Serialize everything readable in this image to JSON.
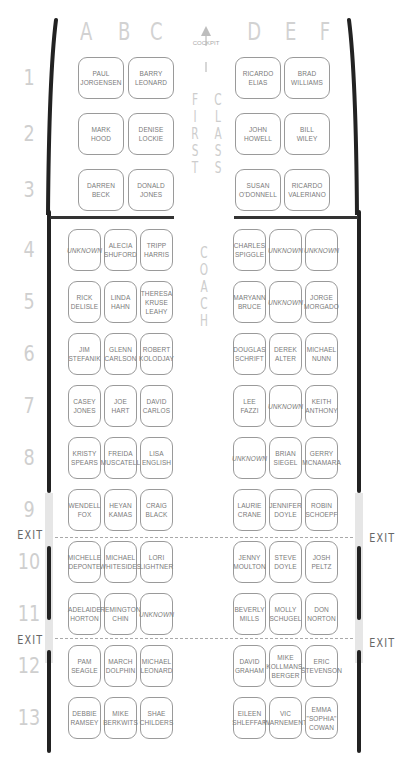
{
  "columns_left": [
    "A",
    "B",
    "C"
  ],
  "columns_right": [
    "D",
    "E",
    "F"
  ],
  "cockpit_label": "COCKPIT",
  "first_class_label": [
    "F",
    "I",
    "R",
    "S",
    "T"
  ],
  "class_label": [
    "C",
    "L",
    "A",
    "S",
    "S"
  ],
  "coach_label": [
    "C",
    "O",
    "A",
    "C",
    "H"
  ],
  "exit_label": "EXIT",
  "rows": [
    {
      "num": "1",
      "left": [
        "",
        "PAUL\nJORGENSEN",
        "BARRY\nLEONARD"
      ],
      "right": [
        "RICARDO\nELIAS",
        "BRAD\nWILLIAMS",
        ""
      ]
    },
    {
      "num": "2",
      "left": [
        "",
        "MARK\nHOOD",
        "DENISE\nLOCKIE"
      ],
      "right": [
        "JOHN\nHOWELL",
        "BILL\nWILEY",
        ""
      ]
    },
    {
      "num": "3",
      "left": [
        "",
        "DARREN\nBECK",
        "DONALD\nJONES"
      ],
      "right": [
        "SUSAN\nO'DONNELL",
        "RICARDO\nVALERIANO",
        ""
      ]
    },
    {
      "num": "4",
      "left": [
        "UNKNOWN",
        "ALECIA\nSHUFORD",
        "TRIPP\nHARRIS"
      ],
      "right": [
        "CHARLES\nSPIGGLE",
        "UNKNOWN",
        "UNKNOWN"
      ]
    },
    {
      "num": "5",
      "left": [
        "RICK\nDELISLE",
        "LINDA\nHAHN",
        "THERESA\nKRUSE\nLEAHY"
      ],
      "right": [
        "MARYANN\nBRUCE",
        "UNKNOWN",
        "JORGE\nMORGADO"
      ]
    },
    {
      "num": "6",
      "left": [
        "JIM\nSTEFANIK",
        "GLENN\nCARLSON",
        "ROBERT\nKOLODJAY"
      ],
      "right": [
        "DOUGLAS\nSCHRIFT",
        "DEREK\nALTER",
        "MICHAEL\nNUNN"
      ]
    },
    {
      "num": "7",
      "left": [
        "CASEY\nJONES",
        "JOE\nHART",
        "DAVID\nCARLOS"
      ],
      "right": [
        "LEE\nFAZZI",
        "UNKNOWN",
        "KEITH\nANTHONY"
      ]
    },
    {
      "num": "8",
      "left": [
        "KRISTY\nSPEARS",
        "FREIDA\nMUSCATELL",
        "LISA\nENGLISH"
      ],
      "right": [
        "UNKNOWN",
        "BRIAN\nSIEGEL",
        "GERRY\nMCNAMARA"
      ]
    },
    {
      "num": "9",
      "left": [
        "WENDELL\nFOX",
        "HEYAN\nKAMAS",
        "CRAIG\nBLACK"
      ],
      "right": [
        "LAURIE\nCRANE",
        "JENNIFER\nDOYLE",
        "ROBIN\nSCHOEPF"
      ]
    },
    {
      "num": "10",
      "left": [
        "MICHELLE\nDEPONTE",
        "MICHAEL\nWHITESIDES",
        "LORI\nLIGHTNER"
      ],
      "right": [
        "JENNY\nMOULTON",
        "STEVE\nDOYLE",
        "JOSH\nPELTZ"
      ]
    },
    {
      "num": "11",
      "left": [
        "ADELAIDE\nHORTON",
        "REMINGTON\nCHIN",
        "UNKNOWN"
      ],
      "right": [
        "BEVERLY\nMILLS",
        "MOLLY\nSCHUGEL",
        "DON\nNORTON"
      ]
    },
    {
      "num": "12",
      "left": [
        "PAM\nSEAGLE",
        "MARCH\nDOLPHIN",
        "MICHAEL\nLEONARD"
      ],
      "right": [
        "DAVID\nGRAHAM",
        "MIKE\nKOLLMANS-\nBERGER",
        "ERIC\nSTEVENSON"
      ]
    },
    {
      "num": "13",
      "left": [
        "DEBBIE\nRAMSEY",
        "MIKE\nBERKWITS",
        "SHAE\nCHILDERS"
      ],
      "right": [
        "EILEEN\nSHLEFFAR",
        "VIC\nWARNEMENT",
        "EMMA\n\"SOPHIA\"\nCOWAN"
      ]
    }
  ]
}
